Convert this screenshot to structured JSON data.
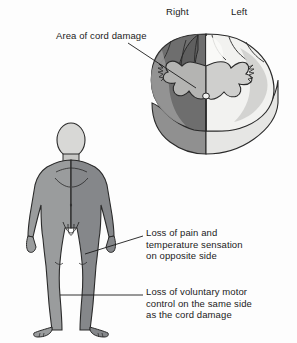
{
  "figure": {
    "title_alt": "Brown-Sequard syndrome: hemisection of the spinal cord",
    "background_color": "#fdfdfd",
    "ink_color": "#1b1b1b"
  },
  "orientation_labels": {
    "right": "Right",
    "left": "Left"
  },
  "cord_annotation": {
    "damage_label": "Area of cord damage"
  },
  "callouts": [
    {
      "id": "sensory-loss",
      "text": "Loss of pain and\ntemperature sensation\non opposite side"
    },
    {
      "id": "motor-loss",
      "text": "Loss of voluntary motor\ncontrol on the same side\nas the cord damage"
    }
  ],
  "palette": {
    "damaged_white_matter": "#6e6e6e",
    "damaged_wedge": "#5f5f5f",
    "damaged_gray_matter": "#b4b4b2",
    "intact_white_matter": "#f2f2f0",
    "intact_gray_matter": "#cfcfcd",
    "cord_side_wall": "#e6e6e4",
    "cord_side_wall_dark": "#909090",
    "body_fill": "#8f9192",
    "body_fill_dark": "#7c7e7f",
    "head_fill": "#d8d8d6",
    "outline": "#2a2a2a"
  }
}
